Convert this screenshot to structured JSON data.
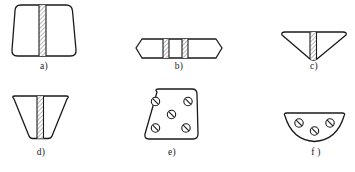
{
  "figure": {
    "background_color": "#ffffff",
    "outline_color": "#1a1a1a",
    "hatch_color": "#7d7d7d",
    "fill_color": "#ffffff",
    "caption_color": "#1a1a1a"
  },
  "items": [
    {
      "id": "a",
      "caption": "a)",
      "shape_name": "rounded-trapezoid-wide-top",
      "feature": "single vertical hatched band, centered",
      "band_count": 1,
      "fastener_count": 0
    },
    {
      "id": "b",
      "caption": "b)",
      "shape_name": "flat-hexagon-horizontal",
      "feature": "two vertical hatched bands",
      "band_count": 2,
      "fastener_count": 0
    },
    {
      "id": "c",
      "caption": "c)",
      "shape_name": "downward-pointing-triangle-rounded-top",
      "feature": "single vertical hatched band, centered",
      "band_count": 1,
      "fastener_count": 0
    },
    {
      "id": "d",
      "caption": "d)",
      "shape_name": "tapered-trapezoid-narrow-bottom",
      "feature": "single vertical hatched band, centered",
      "band_count": 1,
      "fastener_count": 0
    },
    {
      "id": "e",
      "caption": "e)",
      "shape_name": "rounded-trapezoid-wide-bottom",
      "feature": "five slashed-circle fastener marks",
      "band_count": 0,
      "fastener_count": 5
    },
    {
      "id": "f",
      "caption": "f )",
      "shape_name": "half-disc-flat-top",
      "feature": "three slashed-circle fastener marks",
      "band_count": 0,
      "fastener_count": 3
    }
  ]
}
